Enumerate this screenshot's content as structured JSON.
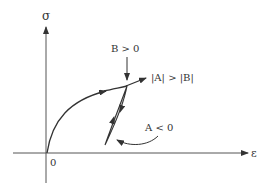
{
  "diagram": {
    "type": "stress-strain curve with hysteresis loop",
    "axes": {
      "y_label": "σ",
      "x_label": "ε",
      "origin_label": "0"
    },
    "annotations": {
      "b_condition": "B > 0",
      "magnitude_condition": "|A| > |B|",
      "a_condition": "A < 0"
    },
    "colors": {
      "stroke": "#333333",
      "loop_fill": "#d9d9d9",
      "background": "#ffffff"
    }
  }
}
